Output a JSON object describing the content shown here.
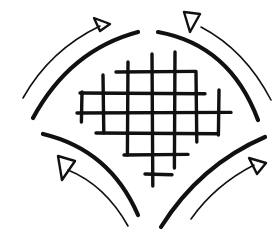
{
  "diagram": {
    "colors": {
      "background": "#ffffff",
      "ink": "#111111"
    },
    "grid": {
      "vertical_lines": [
        {
          "x": 82,
          "y1": 92,
          "y2": 122
        },
        {
          "x": 103,
          "y1": 75,
          "y2": 133
        },
        {
          "x": 128,
          "y1": 62,
          "y2": 155
        },
        {
          "x": 152,
          "y1": 54,
          "y2": 186
        },
        {
          "x": 175,
          "y1": 52,
          "y2": 168
        },
        {
          "x": 196,
          "y1": 73,
          "y2": 142
        },
        {
          "x": 219,
          "y1": 90,
          "y2": 135
        }
      ],
      "horizontal_lines": [
        {
          "y": 72,
          "x1": 116,
          "x2": 196
        },
        {
          "y": 93,
          "x1": 80,
          "x2": 205
        },
        {
          "y": 113,
          "x1": 77,
          "x2": 231
        },
        {
          "y": 133,
          "x1": 96,
          "x2": 218
        },
        {
          "y": 155,
          "x1": 124,
          "x2": 188
        },
        {
          "y": 174,
          "x1": 145,
          "x2": 172
        }
      ]
    },
    "arcs": [
      {
        "name": "top-left",
        "d": "M 33 118 Q 70 50 138 32"
      },
      {
        "name": "top-right",
        "d": "M 158 32 Q 230 45 258 120"
      },
      {
        "name": "bottom-left",
        "d": "M 43 134 Q 110 150 138 215"
      },
      {
        "name": "bottom-right",
        "d": "M 161 227 Q 200 165 265 137"
      }
    ],
    "arrows": [
      {
        "name": "top-left",
        "shaft": "M 23 98 Q 50 50 100 26",
        "head": "M 94 18 L 110 24 L 100 31 Z"
      },
      {
        "name": "top-right",
        "shaft": "M 201 27 Q 245 50 271 100",
        "head": "M 184 12 L 200 14 L 190 32 Z"
      },
      {
        "name": "bottom-left",
        "shaft": "M 128 226 Q 105 185 68 170",
        "head": "M 58 156 L 75 161 L 62 180 Z"
      },
      {
        "name": "bottom-right",
        "shaft": "M 191 219 Q 215 185 254 165",
        "head": "M 249 158 L 266 163 L 257 174 Z"
      }
    ]
  }
}
